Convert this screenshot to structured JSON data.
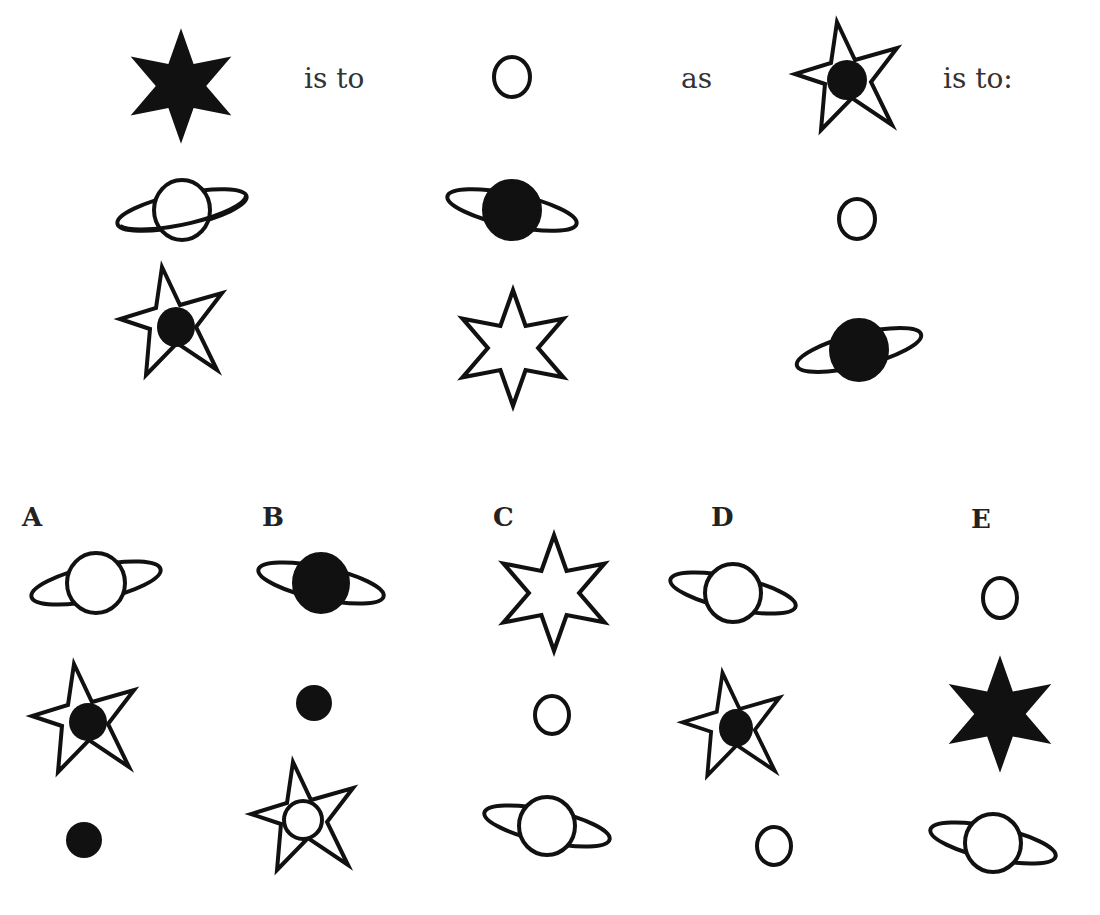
{
  "question": {
    "text_is_to_1": "is to",
    "text_as": "as",
    "text_is_to_2": "is to:",
    "analogy_left": [
      "filled-six-point-star",
      "hollow-circle"
    ],
    "analogy_right": [
      "five-point-star-with-filled-circle"
    ],
    "grid": [
      [
        "ringed-planet-hollow",
        "ringed-planet-filled",
        "hollow-circle"
      ],
      [
        "five-point-star-with-filled-circle",
        "hollow-six-point-star",
        "ringed-planet-filled"
      ]
    ]
  },
  "options": [
    {
      "label": "A",
      "figures": [
        "ringed-planet-hollow",
        "five-point-star-with-filled-circle",
        "filled-circle"
      ]
    },
    {
      "label": "B",
      "figures": [
        "ringed-planet-filled",
        "filled-circle",
        "five-point-star-with-hollow-circle"
      ]
    },
    {
      "label": "C",
      "figures": [
        "hollow-six-point-star",
        "hollow-circle",
        "ringed-planet-hollow"
      ]
    },
    {
      "label": "D",
      "figures": [
        "ringed-planet-hollow",
        "five-point-star-with-filled-circle",
        "hollow-circle"
      ]
    },
    {
      "label": "E",
      "figures": [
        "hollow-circle",
        "filled-six-point-star",
        "ringed-planet-hollow"
      ]
    }
  ],
  "colors": {
    "ink": "#111111",
    "paper": "#ffffff"
  }
}
